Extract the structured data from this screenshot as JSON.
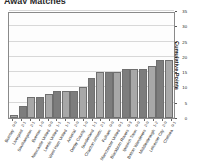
{
  "chart": {
    "title": "Away Matches",
    "y_axis_label": "Cumulative Points",
    "y_ticks": [
      "0",
      "5",
      "10",
      "15",
      "20",
      "25",
      "30",
      "35"
    ]
  },
  "chart_data": {
    "type": "bar",
    "title": "Away Matches",
    "xlabel": "",
    "ylabel": "Cumulative Points",
    "ylim": [
      0,
      35
    ],
    "grid": true,
    "legend": "none",
    "categories": [
      "Burnley",
      "Liverpool",
      "Southampton",
      "Everton",
      "Newcastle United",
      "Leeds United",
      "West Ham United",
      "Arsenal",
      "Derby County",
      "Sunderland",
      "Charlton Athletic",
      "Fulham",
      "Manchester United",
      "Blackburn Rovers",
      "Ipswich Town",
      "Bolton Wanderers",
      "Middlesbrough",
      "Leicester City",
      "Chelsea"
    ],
    "scores": [
      "0-0",
      "2-1",
      "2-1",
      "1-0",
      "0-0",
      "1-1",
      "1-1",
      "2-0",
      "1-0",
      "1-1",
      "2-1",
      "0-0",
      "0-1",
      "0-3",
      "0-0",
      "2-0",
      "1-2",
      "2-0",
      "0-1"
    ],
    "values": [
      1,
      4,
      7,
      7,
      8,
      9,
      9,
      9,
      10,
      13,
      15,
      15,
      15,
      16,
      16,
      16,
      17,
      19,
      19
    ],
    "bar_colors": [
      "#a8a8a8",
      "#7d7d7d"
    ]
  },
  "colors": {
    "bar_light": "#a8a8a8",
    "bar_dark": "#7d7d7d",
    "bar_border": "#6f6f6f",
    "grid": "#d8d8d8",
    "frame": "#8a8a8a",
    "text": "#1a1a1a",
    "background": "#ffffff"
  }
}
